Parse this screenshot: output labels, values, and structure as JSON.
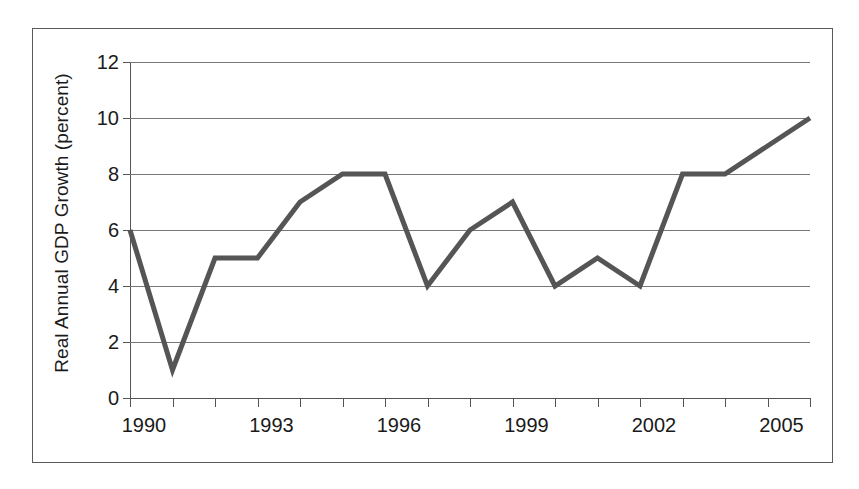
{
  "chart_data": {
    "type": "line",
    "title": "",
    "subtitle": "",
    "xlabel": "",
    "ylabel": "Real Annual GDP Growth (percent)",
    "x": [
      1990,
      1991,
      1992,
      1993,
      1994,
      1995,
      1996,
      1997,
      1998,
      1999,
      2000,
      2001,
      2002,
      2003,
      2004,
      2005,
      2006
    ],
    "values": [
      6,
      1,
      5,
      5,
      7,
      8,
      8,
      4,
      6,
      7,
      4,
      5,
      4,
      8,
      8,
      9,
      10
    ],
    "series": [
      {
        "name": "Real Annual GDP Growth",
        "values": [
          6,
          1,
          5,
          5,
          7,
          8,
          8,
          4,
          6,
          7,
          4,
          5,
          4,
          8,
          8,
          9,
          10
        ],
        "color": "#555555"
      }
    ],
    "xlim": [
      1990,
      2006
    ],
    "ylim": [
      0,
      12
    ],
    "y_ticks": [
      0,
      2,
      4,
      6,
      8,
      10,
      12
    ],
    "y_tick_labels": [
      "0",
      "2",
      "4",
      "6",
      "8",
      "10",
      "12"
    ],
    "x_ticks": [
      1990,
      1991,
      1992,
      1993,
      1994,
      1995,
      1996,
      1997,
      1998,
      1999,
      2000,
      2001,
      2002,
      2003,
      2004,
      2005,
      2006
    ],
    "x_tick_labels": [
      "1990",
      "",
      "",
      "1993",
      "",
      "",
      "1996",
      "",
      "",
      "1999",
      "",
      "",
      "2002",
      "",
      "",
      "2005",
      ""
    ],
    "x_labeled_ticks": [
      "1990",
      "1993",
      "1996",
      "1999",
      "2002",
      "2005"
    ],
    "grid": true,
    "grid_axis": "y",
    "legend": false,
    "legend_position": "none",
    "line_width": 5,
    "markers": false,
    "annotations": []
  },
  "figure": {
    "background_color": "#ffffff",
    "border_color": "#5a5a5a",
    "axis_color": "#555555",
    "grid_color": "#777777",
    "text_color": "#1a1a1a",
    "line_color": "#555555"
  }
}
